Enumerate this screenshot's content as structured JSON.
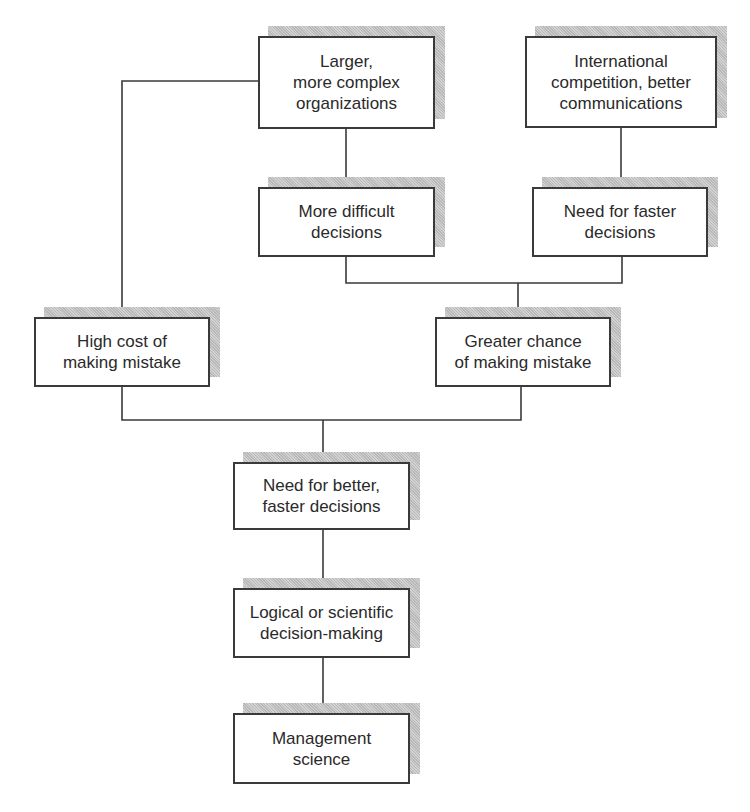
{
  "diagram": {
    "nodes": [
      {
        "id": "larger-orgs",
        "text": "Larger,\nmore complex\norganizations"
      },
      {
        "id": "intl-competition",
        "text": "International\ncompetition, better\ncommunications"
      },
      {
        "id": "more-difficult",
        "text": "More difficult\ndecisions"
      },
      {
        "id": "need-faster",
        "text": "Need for faster\ndecisions"
      },
      {
        "id": "high-cost",
        "text": "High cost of\nmaking mistake"
      },
      {
        "id": "greater-chance",
        "text": "Greater chance\nof making mistake"
      },
      {
        "id": "need-better-faster",
        "text": "Need for better,\nfaster decisions"
      },
      {
        "id": "logical-scientific",
        "text": "Logical or scientific\ndecision-making"
      },
      {
        "id": "management-science",
        "text": "Management\nscience"
      }
    ],
    "edges": [
      {
        "from": "larger-orgs",
        "to": "more-difficult"
      },
      {
        "from": "larger-orgs",
        "to": "high-cost"
      },
      {
        "from": "intl-competition",
        "to": "need-faster"
      },
      {
        "from": "more-difficult",
        "to": "greater-chance"
      },
      {
        "from": "need-faster",
        "to": "greater-chance"
      },
      {
        "from": "high-cost",
        "to": "need-better-faster"
      },
      {
        "from": "greater-chance",
        "to": "need-better-faster"
      },
      {
        "from": "need-better-faster",
        "to": "logical-scientific"
      },
      {
        "from": "logical-scientific",
        "to": "management-science"
      }
    ],
    "colors": {
      "line": "#3a3a3a",
      "shadow": "#c4c4c4",
      "box_fill": "#ffffff"
    }
  }
}
